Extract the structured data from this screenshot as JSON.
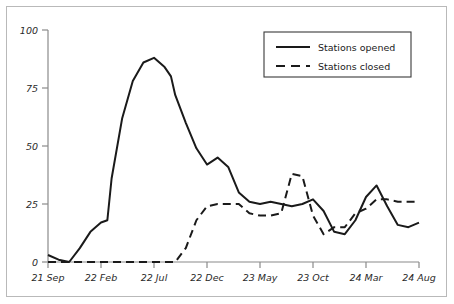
{
  "chart_data": {
    "type": "line",
    "title": "",
    "xlabel": "",
    "ylabel": "",
    "xlim": [
      0,
      35
    ],
    "ylim": [
      0,
      100
    ],
    "grid": false,
    "legend_position": "top-right",
    "y_ticks": [
      "0",
      "25",
      "50",
      "75",
      "100"
    ],
    "y_tick_values": [
      0,
      25,
      50,
      75,
      100
    ],
    "x_ticks": [
      "21 Sep",
      "22 Feb",
      "22 Jul",
      "22 Dec",
      "23 May",
      "23 Oct",
      "24 Mar",
      "24 Aug"
    ],
    "x_tick_values": [
      0,
      5,
      10,
      15,
      20,
      25,
      30,
      35
    ],
    "series": [
      {
        "name": "Stations opened",
        "style": "solid",
        "color": "#1a1a1a",
        "x": [
          0,
          1,
          2,
          3,
          4,
          5,
          5.6,
          6,
          7,
          8,
          9,
          10,
          11,
          11.6,
          12,
          13,
          14,
          15,
          16,
          17,
          18,
          19,
          20,
          21,
          22,
          23,
          24,
          25,
          26,
          27,
          28,
          29,
          30,
          31,
          32,
          33,
          34,
          35
        ],
        "values": [
          3,
          1,
          0,
          6,
          13,
          17,
          18,
          36,
          62,
          78,
          86,
          88,
          84,
          80,
          72,
          60,
          49,
          42,
          45,
          41,
          30,
          26,
          25,
          26,
          25,
          24,
          25,
          27,
          22,
          13,
          12,
          18,
          28,
          33,
          24,
          16,
          15,
          17
        ]
      },
      {
        "name": "Stations closed",
        "style": "dashed",
        "color": "#1a1a1a",
        "x": [
          0,
          1,
          2,
          3,
          4,
          5,
          6,
          7,
          8,
          9,
          10,
          11,
          12,
          13,
          14,
          15,
          16,
          17,
          18,
          19,
          20,
          21,
          22,
          23,
          24,
          25,
          26,
          27,
          28,
          29,
          30,
          31,
          32,
          33,
          34,
          35
        ],
        "values": [
          0,
          0,
          0,
          0,
          0,
          0,
          0,
          0,
          0,
          0,
          0,
          0,
          0,
          6,
          18,
          24,
          25,
          25,
          25,
          21,
          20,
          20,
          21,
          38,
          37,
          20,
          12,
          15,
          15,
          21,
          23,
          27,
          27,
          26,
          26,
          26
        ]
      }
    ]
  },
  "legend": {
    "items": [
      {
        "label": "Stations opened",
        "style": "solid"
      },
      {
        "label": "Stations closed",
        "style": "dashed"
      }
    ]
  },
  "colors": {
    "line": "#1a1a1a",
    "axis": "#8a8a8a",
    "frame": "#b9b9b9",
    "text": "#2a2a2a",
    "background": "#ffffff"
  }
}
